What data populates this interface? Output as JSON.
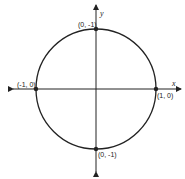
{
  "diagram": {
    "type": "unit-circle",
    "axes": {
      "x_label": "x",
      "y_label": "y"
    },
    "circle": {
      "center": [
        0,
        0
      ],
      "radius": 1
    },
    "points": [
      {
        "name": "top",
        "coords": [
          0,
          1
        ],
        "label": "(0, -1)"
      },
      {
        "name": "left",
        "coords": [
          -1,
          0
        ],
        "label": "(-1, 0)"
      },
      {
        "name": "right",
        "coords": [
          1,
          0
        ],
        "label": "(1, 0)"
      },
      {
        "name": "bottom",
        "coords": [
          0,
          -1
        ],
        "label": "(0, -1)"
      }
    ],
    "colors": {
      "stroke": "#222222",
      "background": "#ffffff"
    }
  }
}
